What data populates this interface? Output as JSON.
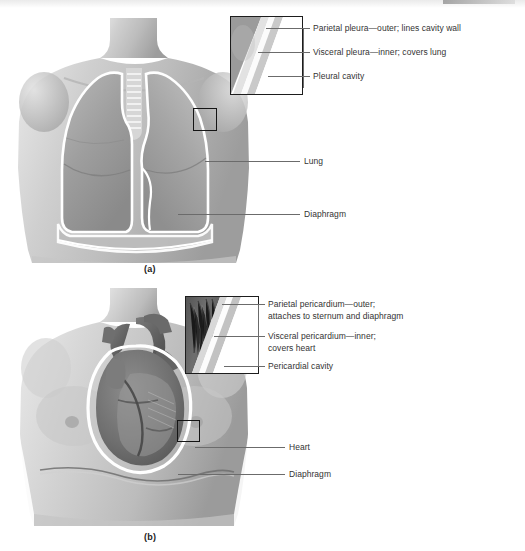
{
  "figure": {
    "background": "#ffffff",
    "line_color": "#6b6b6b",
    "text_color": "#333333"
  },
  "panels": [
    {
      "id": "a",
      "caption": "(a)",
      "subject": "thorax-lungs-pleura",
      "inset": {
        "name": "pleura-inset",
        "description": "magnified layers of pleural membranes at lung surface"
      },
      "marker": {
        "name": "pleura-marker-box",
        "description": "small square on left lung marking magnified region"
      },
      "callouts": [
        {
          "name": "parietal-pleura",
          "text": "Parietal pleura—outer; lines cavity wall"
        },
        {
          "name": "visceral-pleura",
          "text": "Visceral pleura—inner; covers lung"
        },
        {
          "name": "pleural-cavity",
          "text": "Pleural cavity"
        }
      ],
      "organ_labels": [
        {
          "name": "lung",
          "text": "Lung"
        },
        {
          "name": "diaphragm",
          "text": "Diaphragm"
        }
      ]
    },
    {
      "id": "b",
      "caption": "(b)",
      "subject": "thorax-heart-pericardium",
      "inset": {
        "name": "pericardium-inset",
        "description": "magnified layers of pericardial membranes at heart surface"
      },
      "marker": {
        "name": "pericardium-marker-box",
        "description": "small square on heart marking magnified region"
      },
      "callouts": [
        {
          "name": "parietal-pericardium",
          "text": "Parietal pericardium—outer;\nattaches to sternum and diaphragm"
        },
        {
          "name": "visceral-pericardium",
          "text": "Visceral pericardium—inner;\ncovers heart"
        },
        {
          "name": "pericardial-cavity",
          "text": "Pericardial cavity"
        }
      ],
      "organ_labels": [
        {
          "name": "heart",
          "text": "Heart"
        },
        {
          "name": "diaphragm",
          "text": "Diaphragm"
        }
      ]
    }
  ]
}
